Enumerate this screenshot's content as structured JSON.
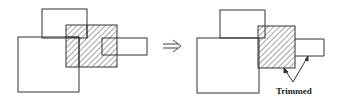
{
  "diagram": {
    "before": {
      "shapes": [
        "top-rectangle",
        "big-square",
        "hatched-rectangle",
        "small-right-rectangle"
      ]
    },
    "arrow": {
      "glyph": "⇒"
    },
    "after": {
      "shapes": [
        "top-rectangle",
        "big-square",
        "hatched-rectangle",
        "small-right-rectangle"
      ],
      "annotation": "Trimmed"
    },
    "colors": {
      "stroke": "#333333",
      "background": "#ffffff"
    }
  }
}
